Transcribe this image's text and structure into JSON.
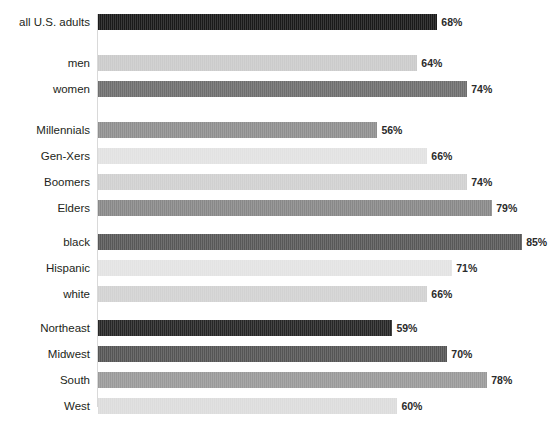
{
  "chart_data": {
    "type": "bar",
    "orientation": "horizontal",
    "title": "",
    "xlabel": "",
    "ylabel": "",
    "xlim": [
      0,
      100
    ],
    "grid": false,
    "legend": "none",
    "value_suffix": "%",
    "axis_line_color": "#d9d9d9",
    "background": "#ffffff",
    "categories": [
      "all U.S. adults",
      "men",
      "women",
      "Millennials",
      "Gen-Xers",
      "Boomers",
      "Elders",
      "black",
      "Hispanic",
      "white",
      "Northeast",
      "Midwest",
      "South",
      "West"
    ],
    "values": [
      68,
      64,
      74,
      56,
      66,
      74,
      79,
      85,
      71,
      66,
      59,
      70,
      78,
      60
    ],
    "value_labels": [
      "68%",
      "64%",
      "74%",
      "56%",
      "66%",
      "74%",
      "79%",
      "85%",
      "71%",
      "66%",
      "59%",
      "70%",
      "78%",
      "60%"
    ],
    "bar_colors": [
      "#1a1a1a",
      "#cbcbcb",
      "#6e6e6e",
      "#8f8f8f",
      "#e2e2e2",
      "#d0d0d0",
      "#888888",
      "#585858",
      "#e3e3e3",
      "#d2d2d2",
      "#272727",
      "#555555",
      "#9a9a9a",
      "#dcdcdc"
    ],
    "groups": [
      {
        "name": "total",
        "categories": [
          "all U.S. adults"
        ]
      },
      {
        "name": "gender",
        "categories": [
          "men",
          "women"
        ]
      },
      {
        "name": "generation",
        "categories": [
          "Millennials",
          "Gen-Xers",
          "Boomers",
          "Elders"
        ]
      },
      {
        "name": "race",
        "categories": [
          "black",
          "Hispanic",
          "white"
        ]
      },
      {
        "name": "region",
        "categories": [
          "Northeast",
          "Midwest",
          "South",
          "West"
        ]
      }
    ]
  },
  "layout": {
    "rows": [
      {
        "label": "all U.S. adults",
        "value": 68,
        "value_label": "68%",
        "color": "#1a1a1a",
        "top": 14
      },
      {
        "label": "men",
        "value": 64,
        "value_label": "64%",
        "color": "#cbcbcb",
        "top": 55
      },
      {
        "label": "women",
        "value": 74,
        "value_label": "74%",
        "color": "#6e6e6e",
        "top": 81
      },
      {
        "label": "Millennials",
        "value": 56,
        "value_label": "56%",
        "color": "#8f8f8f",
        "top": 122
      },
      {
        "label": "Gen-Xers",
        "value": 66,
        "value_label": "66%",
        "color": "#e2e2e2",
        "top": 148
      },
      {
        "label": "Boomers",
        "value": 74,
        "value_label": "74%",
        "color": "#d0d0d0",
        "top": 174
      },
      {
        "label": "Elders",
        "value": 79,
        "value_label": "79%",
        "color": "#888888",
        "top": 200
      },
      {
        "label": "black",
        "value": 85,
        "value_label": "85%",
        "color": "#585858",
        "top": 234
      },
      {
        "label": "Hispanic",
        "value": 71,
        "value_label": "71%",
        "color": "#e3e3e3",
        "top": 260
      },
      {
        "label": "white",
        "value": 66,
        "value_label": "66%",
        "color": "#d2d2d2",
        "top": 286
      },
      {
        "label": "Northeast",
        "value": 59,
        "value_label": "59%",
        "color": "#272727",
        "top": 320
      },
      {
        "label": "Midwest",
        "value": 70,
        "value_label": "70%",
        "color": "#555555",
        "top": 346
      },
      {
        "label": "South",
        "value": 78,
        "value_label": "78%",
        "color": "#9a9a9a",
        "top": 372
      },
      {
        "label": "West",
        "value": 60,
        "value_label": "60%",
        "color": "#dcdcdc",
        "top": 398
      }
    ],
    "px_per_percent": 4.99,
    "bar_origin_x": 98
  }
}
